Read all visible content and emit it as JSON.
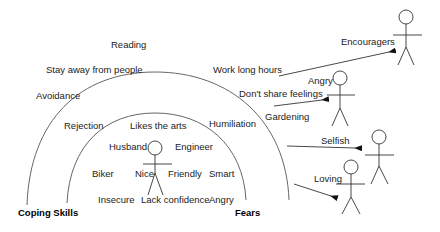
{
  "diagram": {
    "outer_ring_labels": [
      {
        "text": "Reading",
        "x": 111,
        "y": 43
      },
      {
        "text": "Stay away from people",
        "x": 46,
        "y": 65
      },
      {
        "text": "Avoidance",
        "x": 36,
        "y": 91
      },
      {
        "text": "Rejection",
        "x": 64,
        "y": 122
      },
      {
        "text": "Humiliation",
        "x": 209,
        "y": 120
      }
    ],
    "outer_ring_labels_right": [
      {
        "text": "Work long hours",
        "x": 213,
        "y": 65
      },
      {
        "text": "Don't share feelings",
        "x": 239,
        "y": 89
      },
      {
        "text": "Gardening",
        "x": 265,
        "y": 113
      }
    ],
    "inner_ring_labels": [
      {
        "text": "Likes the arts",
        "x": 130,
        "y": 122
      },
      {
        "text": "Husband",
        "x": 109,
        "y": 143
      },
      {
        "text": "Engineer",
        "x": 175,
        "y": 143
      },
      {
        "text": "Biker",
        "x": 92,
        "y": 170
      },
      {
        "text": "Nice",
        "x": 135,
        "y": 170
      },
      {
        "text": "Friendly",
        "x": 168,
        "y": 170
      },
      {
        "text": "Smart",
        "x": 209,
        "y": 170
      },
      {
        "text": "Insecure",
        "x": 98,
        "y": 196
      },
      {
        "text": "Lack confidence",
        "x": 141,
        "y": 196
      },
      {
        "text": "Angry",
        "x": 209,
        "y": 196
      }
    ],
    "ring_titles": {
      "coping": {
        "text": "Coping Skills",
        "x": 18,
        "y": 210
      },
      "fears": {
        "text": "Fears",
        "x": 235,
        "y": 210
      }
    },
    "actors": [
      {
        "label": "Encouragers",
        "label_x": 341,
        "label_y": 40
      },
      {
        "label": "Angry",
        "label_x": 308,
        "label_y": 80
      },
      {
        "label": "Selfish",
        "label_x": 321,
        "label_y": 139
      },
      {
        "label": "Loving",
        "label_x": 314,
        "label_y": 177
      }
    ]
  }
}
